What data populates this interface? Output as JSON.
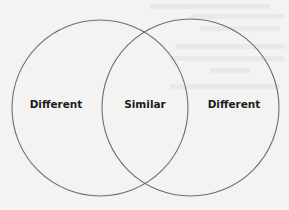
{
  "diagram": {
    "type": "venn",
    "sets": [
      {
        "id": "left",
        "label": "Different"
      },
      {
        "id": "right",
        "label": "Different"
      }
    ],
    "intersection": {
      "label": "Similar"
    }
  },
  "colors": {
    "background": "#f3f3f1",
    "outline": "#6e6e6e",
    "text": "#1c1c1c"
  }
}
